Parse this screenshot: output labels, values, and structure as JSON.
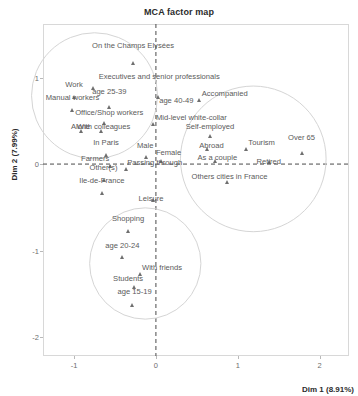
{
  "chart_data": {
    "type": "scatter",
    "title": "MCA factor map",
    "xlabel": "Dim 1 (8.91%)",
    "ylabel": "Dim 2 (7.99%)",
    "xlim": [
      -1.38,
      2.36
    ],
    "ylim": [
      -2.22,
      1.62
    ],
    "xticks": [
      -1,
      0,
      1,
      2
    ],
    "xticklabels": [
      "-1",
      "0",
      "1",
      "2"
    ],
    "yticks": [
      -2,
      -1,
      0,
      1
    ],
    "yticklabels": [
      "-2",
      "-1",
      "0",
      "1"
    ],
    "grid": false,
    "legend": null,
    "reference_lines": {
      "x": 0,
      "y": 0,
      "style": "dashed",
      "color": "#4a4a4a"
    },
    "marker": "triangle",
    "marker_color": "#6f6f6f",
    "points": [
      {
        "label": "On the Champs Elysées",
        "x": -0.28,
        "y": 1.17,
        "anchor": "c",
        "lx": -0.28,
        "ly": 1.3
      },
      {
        "label": "Executives and senior professionals",
        "x": -0.77,
        "y": 0.88,
        "anchor": "l",
        "lx": -0.7,
        "ly": 0.94
      },
      {
        "label": "Work",
        "x": -1.0,
        "y": 0.77,
        "anchor": "c",
        "lx": -1.0,
        "ly": 0.84
      },
      {
        "label": "Manual workers",
        "x": -1.02,
        "y": 0.63,
        "anchor": "c",
        "lx": -1.02,
        "ly": 0.7
      },
      {
        "label": "age 25-39",
        "x": -0.57,
        "y": 0.66,
        "anchor": "c",
        "lx": -0.57,
        "ly": 0.76
      },
      {
        "label": "age 40-49",
        "x": 0.03,
        "y": 0.77,
        "anchor": "l",
        "lx": 0.04,
        "ly": 0.66
      },
      {
        "label": "Accompanied",
        "x": 0.53,
        "y": 0.74,
        "anchor": "l",
        "lx": 0.56,
        "ly": 0.74
      },
      {
        "label": "Office/Shop workers",
        "x": -0.64,
        "y": 0.48,
        "anchor": "c",
        "lx": -0.57,
        "ly": 0.52
      },
      {
        "label": "Mid-level white-collar",
        "x": -0.03,
        "y": 0.46,
        "anchor": "l",
        "lx": 0.0,
        "ly": 0.46
      },
      {
        "label": "Alone",
        "x": -0.92,
        "y": 0.38,
        "anchor": "c",
        "lx": -0.92,
        "ly": 0.36
      },
      {
        "label": "With colleagues",
        "x": -0.67,
        "y": 0.38,
        "anchor": "c",
        "lx": -0.64,
        "ly": 0.36
      },
      {
        "label": "Self-employed",
        "x": 0.66,
        "y": 0.33,
        "anchor": "c",
        "lx": 0.66,
        "ly": 0.36
      },
      {
        "label": "Tourism",
        "x": 1.1,
        "y": 0.18,
        "anchor": "l",
        "lx": 1.13,
        "ly": 0.18
      },
      {
        "label": "Over 65",
        "x": 1.78,
        "y": 0.13,
        "anchor": "c",
        "lx": 1.78,
        "ly": 0.23
      },
      {
        "label": "Abroad",
        "x": 0.62,
        "y": 0.18,
        "anchor": "c",
        "lx": 0.68,
        "ly": 0.14
      },
      {
        "label": "In Paris",
        "x": -0.61,
        "y": 0.11,
        "anchor": "c",
        "lx": -0.61,
        "ly": 0.17
      },
      {
        "label": "Male",
        "x": -0.12,
        "y": 0.08,
        "anchor": "c",
        "lx": -0.13,
        "ly": 0.14
      },
      {
        "label": "Female",
        "x": 0.06,
        "y": 0.04,
        "anchor": "l",
        "lx": 0.0,
        "ly": 0.06
      },
      {
        "label": "As a couple",
        "x": 0.72,
        "y": 0.03,
        "anchor": "c",
        "lx": 0.75,
        "ly": 0.0
      },
      {
        "label": "Retired",
        "x": 1.38,
        "y": 0.02,
        "anchor": "c",
        "lx": 1.38,
        "ly": -0.04
      },
      {
        "label": "Farmers",
        "x": -0.56,
        "y": -0.02,
        "anchor": "r",
        "lx": -0.57,
        "ly": -0.01
      },
      {
        "label": "Passing through",
        "x": -0.37,
        "y": -0.06,
        "anchor": "l",
        "lx": -0.35,
        "ly": -0.06
      },
      {
        "label": "Other(s)",
        "x": -0.64,
        "y": -0.18,
        "anchor": "c",
        "lx": -0.64,
        "ly": -0.11
      },
      {
        "label": "Others cities in France",
        "x": 0.87,
        "y": -0.21,
        "anchor": "c",
        "lx": 0.9,
        "ly": -0.22
      },
      {
        "label": "Ile-de-France",
        "x": -0.66,
        "y": -0.33,
        "anchor": "c",
        "lx": -0.66,
        "ly": -0.26
      },
      {
        "label": "Leisure",
        "x": -0.03,
        "y": -0.42,
        "anchor": "c",
        "lx": -0.06,
        "ly": -0.47
      },
      {
        "label": "Shopping",
        "x": -0.34,
        "y": -0.77,
        "anchor": "c",
        "lx": -0.34,
        "ly": -0.7
      },
      {
        "label": "age 20-24",
        "x": -0.41,
        "y": -1.08,
        "anchor": "c",
        "lx": -0.41,
        "ly": -1.02
      },
      {
        "label": "With friends",
        "x": -0.2,
        "y": -1.27,
        "anchor": "l",
        "lx": -0.17,
        "ly": -1.27
      },
      {
        "label": "Students",
        "x": -0.27,
        "y": -1.42,
        "anchor": "c",
        "lx": -0.34,
        "ly": -1.4
      },
      {
        "label": "age 15-19",
        "x": -0.29,
        "y": -1.63,
        "anchor": "c",
        "lx": -0.26,
        "ly": -1.55
      }
    ],
    "cluster_circles": [
      {
        "name": "upper-left-cluster",
        "cx": -0.75,
        "cy": 0.79,
        "r": 0.77
      },
      {
        "name": "right-cluster",
        "cx": 1.19,
        "cy": 0.06,
        "r": 0.89
      },
      {
        "name": "bottom-cluster",
        "cx": -0.13,
        "cy": -1.15,
        "r": 0.68
      }
    ]
  }
}
